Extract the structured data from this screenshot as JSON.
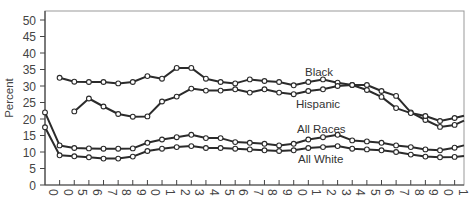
{
  "chart_data": {
    "type": "line",
    "title": "",
    "xlabel": "",
    "ylabel": "Percent",
    "ylim": [
      0,
      50
    ],
    "y_ticks": [
      "0",
      "5",
      "10",
      "15",
      "20",
      "25",
      "30",
      "35",
      "40",
      "45",
      "50"
    ],
    "x_tick_labels": [
      "0",
      "0",
      "5",
      "6",
      "7",
      "8",
      "9",
      "0",
      "1",
      "2",
      "3",
      "4",
      "5",
      "6",
      "7",
      "8",
      "9",
      "0",
      "1",
      "2",
      "3",
      "4",
      "5",
      "6",
      "7",
      "8",
      "9",
      "0",
      "1"
    ],
    "grid": false,
    "legend": "inline labels",
    "series": [
      {
        "name": "Black",
        "start_index": 1,
        "values": [
          32.5,
          31.3,
          31.2,
          31.2,
          30.8,
          31.2,
          33.0,
          32.2,
          35.5,
          35.5,
          32.2,
          31.2,
          30.8,
          32.0,
          31.5,
          31.2,
          30.2,
          31.2,
          32.0,
          31.0,
          30.3,
          30.3,
          28.5,
          27.0,
          22.0,
          19.7,
          17.6,
          18.2
        ],
        "end_value": 19.5
      },
      {
        "name": "Hispanic",
        "start_index": 2,
        "values": [
          22.3,
          26.2,
          23.8,
          21.5,
          20.7,
          20.8,
          25.3,
          26.8,
          29.2,
          28.6,
          28.6,
          29.0,
          28.0,
          29.0,
          28.0,
          27.5,
          28.5,
          29.0,
          30.0,
          30.3,
          28.8,
          26.7,
          23.3,
          21.8,
          20.9,
          19.4,
          20.3
        ],
        "end_value": 21.0
      },
      {
        "name": "All Races",
        "start_index": 0,
        "values": [
          22.0,
          12.0,
          11.2,
          11.1,
          11.0,
          11.0,
          11.1,
          12.8,
          13.8,
          14.5,
          15.2,
          14.2,
          14.2,
          13.0,
          12.8,
          12.5,
          12.0,
          12.5,
          13.8,
          14.5,
          15.2,
          13.5,
          13.2,
          12.8,
          12.0,
          11.5,
          10.8,
          10.5,
          11.3
        ],
        "end_value": 12.0
      },
      {
        "name": "All White",
        "start_index": 0,
        "values": [
          17.5,
          9.0,
          8.7,
          8.4,
          8.0,
          8.0,
          8.6,
          10.3,
          11.0,
          11.5,
          11.8,
          11.2,
          11.2,
          11.0,
          10.8,
          10.5,
          10.3,
          10.5,
          11.2,
          11.5,
          11.8,
          11.0,
          10.8,
          10.5,
          10.0,
          9.2,
          8.6,
          8.4,
          8.5
        ],
        "end_value": 8.8
      }
    ],
    "annotations": [
      {
        "text": "Black",
        "series": "Black"
      },
      {
        "text": "Hispanic",
        "series": "Hispanic"
      },
      {
        "text": "All Races",
        "series": "All Races"
      },
      {
        "text": "All White",
        "series": "All White"
      }
    ]
  }
}
